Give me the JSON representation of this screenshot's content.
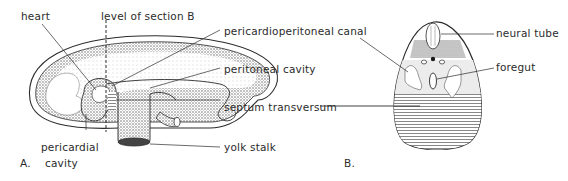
{
  "figure_a": {
    "panel_label": "A.",
    "labels": {
      "heart": "heart",
      "level_of_section": "level of section B",
      "pericardioperitoneal_canal": "pericardioperitoneal canal",
      "peritoneal_cavity": "peritoneal cavity",
      "septum_transversum": "septum  transversum",
      "yolk_stalk": "yolk stalk",
      "pericardial_cavity_line1": "pericardial",
      "pericardial_cavity_line2": "cavity"
    }
  },
  "figure_b": {
    "panel_label": "B.",
    "labels": {
      "neural_tube": "neural tube",
      "foregut": "foregut"
    }
  },
  "colors": {
    "ink": "#2b2b2b",
    "stipple": "#6a6a6a",
    "light_gray": "#d9d9d9",
    "hatch": "#8a8a8a"
  }
}
